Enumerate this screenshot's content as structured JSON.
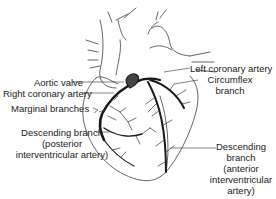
{
  "diagram": {
    "type": "anatomical-illustration",
    "colors": {
      "outline": "#444444",
      "artery": "#1a1a1a",
      "text": "#222222",
      "background": "#ffffff"
    },
    "labels": {
      "aortic_valve": "Aortic valve",
      "right_coronary_artery": "Right coronary artery",
      "marginal_branches": "Marginal branches",
      "posterior_descending": [
        "Descending branch",
        "(posterior",
        "interventricular artery)"
      ],
      "left_coronary_artery": "Left coronary artery",
      "circumflex": [
        "Circumflex",
        "branch"
      ],
      "anterior_descending": [
        "Descending",
        "branch",
        "(anterior",
        "interventricular",
        "artery)"
      ]
    }
  }
}
